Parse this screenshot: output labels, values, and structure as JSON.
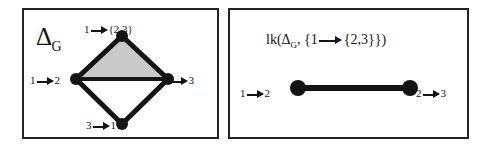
{
  "figure": {
    "caption_present": false,
    "panel_count": 2,
    "colors": {
      "ink": "#1a1a1a",
      "border": "#242424",
      "shaded_face": "#c9c9c9",
      "background": "#ffffff",
      "vertex": "#141414"
    }
  },
  "left_panel": {
    "heading": {
      "symbol": "Δ",
      "subscript": "G"
    },
    "complex": {
      "type": "simplicial-complex",
      "shape": "diamond",
      "vertices": [
        {
          "id": "top",
          "label_main": "1",
          "label_target": "{2,3}",
          "x": 54,
          "y": 12
        },
        {
          "id": "left",
          "label_main": "1",
          "label_target": "2",
          "x": 8,
          "y": 55
        },
        {
          "id": "right",
          "label_main": "2",
          "label_target": "3",
          "x": 100,
          "y": 55
        },
        {
          "id": "bottom",
          "label_main": "3",
          "label_target": "1",
          "x": 54,
          "y": 100
        }
      ],
      "edges": [
        [
          "top",
          "left"
        ],
        [
          "top",
          "right"
        ],
        [
          "left",
          "right"
        ],
        [
          "left",
          "bottom"
        ],
        [
          "right",
          "bottom"
        ]
      ],
      "filled_faces": [
        [
          "top",
          "left",
          "right"
        ]
      ]
    },
    "labels": {
      "top": {
        "source": "1",
        "target": "{2,3}"
      },
      "left": {
        "source": "1",
        "target": "2"
      },
      "right": {
        "source": "2",
        "target": "3"
      },
      "bottom": {
        "source": "3",
        "target": "1"
      }
    }
  },
  "right_panel": {
    "formula": {
      "function_name": "lk",
      "open_paren": "(",
      "arg1_symbol": "Δ",
      "arg1_subscript": "G",
      "comma": ",",
      "arg2_open_brace": "{",
      "arg2_source": "1",
      "arg2_target": "{2,3}",
      "arg2_close_brace": "}",
      "close_paren": ")"
    },
    "link_complex": {
      "type": "simplicial-complex",
      "shape": "edge",
      "vertices": [
        {
          "id": "left",
          "label_main": "1",
          "label_target": "2",
          "x": 30,
          "y": 20
        },
        {
          "id": "right",
          "label_main": "2",
          "label_target": "3",
          "x": 142,
          "y": 20
        }
      ],
      "edges": [
        [
          "left",
          "right"
        ]
      ],
      "filled_faces": []
    },
    "labels": {
      "left": {
        "source": "1",
        "target": "2"
      },
      "right": {
        "source": "2",
        "target": "3"
      }
    }
  }
}
